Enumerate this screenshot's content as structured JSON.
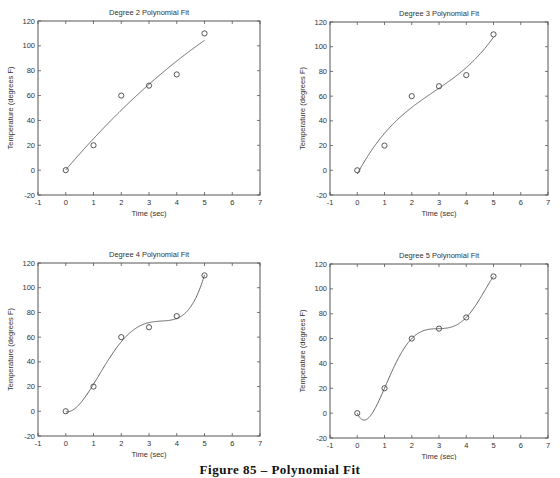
{
  "figure": {
    "caption": "Figure 85 – Polynomial Fit"
  },
  "chart_data": [
    {
      "type": "scatter",
      "title": "Degree 2 Polynomial Fit",
      "xlabel": "Time (sec)",
      "ylabel": "Temperature (degrees F)",
      "degree": 2,
      "x": [
        0,
        1,
        2,
        3,
        4,
        5
      ],
      "y": [
        0,
        20,
        60,
        68,
        77,
        110
      ],
      "xlim": [
        -1,
        7
      ],
      "ylim": [
        -20,
        120
      ],
      "xticks": [
        -1,
        0,
        1,
        2,
        3,
        4,
        5,
        6,
        7
      ],
      "yticks": [
        -20,
        0,
        20,
        40,
        60,
        80,
        100,
        120
      ],
      "marker": "circle",
      "fit_line": "polynomial degree 2 over x in [0,5]",
      "grid": false,
      "legend": null
    },
    {
      "type": "scatter",
      "title": "Degree 3 Polynomial Fit",
      "xlabel": "Time (sec)",
      "ylabel": "Temperature (degrees F)",
      "degree": 3,
      "x": [
        0,
        1,
        2,
        3,
        4,
        5
      ],
      "y": [
        0,
        20,
        60,
        68,
        77,
        110
      ],
      "xlim": [
        -1,
        7
      ],
      "ylim": [
        -20,
        120
      ],
      "xticks": [
        -1,
        0,
        1,
        2,
        3,
        4,
        5,
        6,
        7
      ],
      "yticks": [
        -20,
        0,
        20,
        40,
        60,
        80,
        100,
        120
      ],
      "marker": "circle",
      "fit_line": "polynomial degree 3 over x in [0,5]",
      "grid": false,
      "legend": null
    },
    {
      "type": "scatter",
      "title": "Degree 4 Polynomial Fit",
      "xlabel": "Time (sec)",
      "ylabel": "Temperature (degrees F)",
      "degree": 4,
      "x": [
        0,
        1,
        2,
        3,
        4,
        5
      ],
      "y": [
        0,
        20,
        60,
        68,
        77,
        110
      ],
      "xlim": [
        -1,
        7
      ],
      "ylim": [
        -20,
        120
      ],
      "xticks": [
        -1,
        0,
        1,
        2,
        3,
        4,
        5,
        6,
        7
      ],
      "yticks": [
        -20,
        0,
        20,
        40,
        60,
        80,
        100,
        120
      ],
      "marker": "circle",
      "fit_line": "polynomial degree 4 over x in [0,5]",
      "grid": false,
      "legend": null
    },
    {
      "type": "scatter",
      "title": "Degree 5 Polynomial Fit",
      "xlabel": "Time (sec)",
      "ylabel": "Temperature (degrees F)",
      "degree": 5,
      "x": [
        0,
        1,
        2,
        3,
        4,
        5
      ],
      "y": [
        0,
        20,
        60,
        68,
        77,
        110
      ],
      "xlim": [
        -1,
        7
      ],
      "ylim": [
        -20,
        120
      ],
      "xticks": [
        -1,
        0,
        1,
        2,
        3,
        4,
        5,
        6,
        7
      ],
      "yticks": [
        -20,
        0,
        20,
        40,
        60,
        80,
        100,
        120
      ],
      "marker": "circle",
      "fit_line": "polynomial degree 5 over x in [0,5]",
      "grid": false,
      "legend": null
    }
  ],
  "style": {
    "axis_color": "#555555",
    "line_color": "#666666",
    "marker_color": "#444444",
    "text_color": "#333333"
  }
}
